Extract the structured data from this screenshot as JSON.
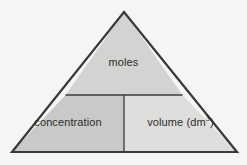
{
  "diagram": {
    "type": "formula-triangle",
    "colors": {
      "background": "#f5f5f3",
      "top_cell_fill": "#d3d3d1",
      "bottom_left_cell_fill": "#c9c9c7",
      "bottom_right_cell_fill": "#dededc",
      "outline": "#3a3a3a",
      "divider": "#3a3a3a",
      "text": "#2b2b2b"
    },
    "cells": {
      "top": {
        "label": "moles"
      },
      "bottom_left": {
        "label": "concentration"
      },
      "bottom_right": {
        "label_prefix": "volume (dm",
        "label_superscript": "3",
        "label_suffix": ")"
      }
    }
  }
}
